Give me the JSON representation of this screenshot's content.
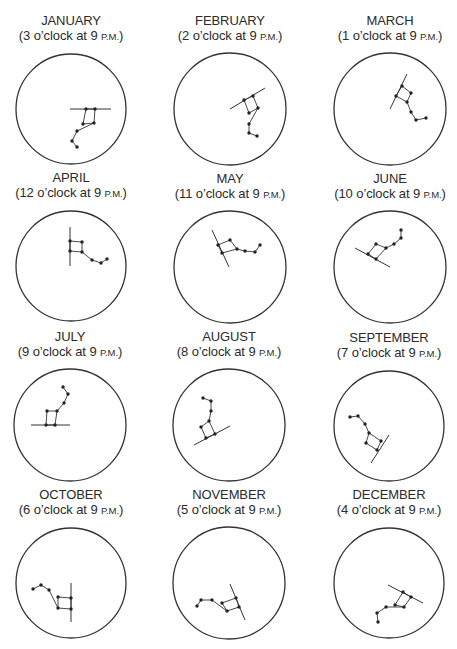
{
  "figure": {
    "panels": [
      {
        "month": "JANUARY",
        "clock": "3",
        "center": [
          71,
          109
        ],
        "r": 55,
        "horizon": [
          [
            70,
            109
          ],
          [
            111,
            109
          ]
        ],
        "stars": [
          [
            86,
            109
          ],
          [
            95,
            109
          ],
          [
            94,
            123
          ],
          [
            83,
            124
          ],
          [
            77,
            131
          ],
          [
            72,
            141
          ],
          [
            77,
            147
          ]
        ]
      },
      {
        "month": "FEBRUARY",
        "clock": "2",
        "center": [
          230,
          109
        ],
        "r": 56,
        "horizon": [
          [
            230,
            109
          ],
          [
            265,
            88
          ]
        ],
        "stars": [
          [
            244,
            100
          ],
          [
            253,
            96
          ],
          [
            258,
            108
          ],
          [
            249,
            113
          ],
          [
            249,
            124
          ],
          [
            249,
            133
          ],
          [
            257,
            136
          ]
        ]
      },
      {
        "month": "MARCH",
        "clock": "1",
        "center": [
          390,
          109
        ],
        "r": 56,
        "horizon": [
          [
            407,
            74
          ],
          [
            390,
            109
          ]
        ],
        "stars": [
          [
            402,
            86
          ],
          [
            411,
            93
          ],
          [
            407,
            102
          ],
          [
            396,
            96
          ],
          [
            411,
            112
          ],
          [
            416,
            120
          ],
          [
            426,
            118
          ]
        ]
      },
      {
        "month": "APRIL",
        "clock": "12",
        "center": [
          71,
          266
        ],
        "r": 55,
        "horizon": [
          [
            70,
            227
          ],
          [
            70,
            266
          ]
        ],
        "stars": [
          [
            70,
            241
          ],
          [
            82,
            242
          ],
          [
            82,
            252
          ],
          [
            70,
            251
          ],
          [
            92,
            260
          ],
          [
            101,
            263
          ],
          [
            107,
            259
          ]
        ]
      },
      {
        "month": "MAY",
        "clock": "11",
        "center": [
          230,
          267
        ],
        "r": 56,
        "horizon": [
          [
            212,
            230
          ],
          [
            229,
            267
          ]
        ],
        "stars": [
          [
            218,
            245
          ],
          [
            230,
            240
          ],
          [
            237,
            249
          ],
          [
            222,
            253
          ],
          [
            245,
            251
          ],
          [
            255,
            252
          ],
          [
            260,
            245
          ]
        ]
      },
      {
        "month": "JUNE",
        "clock": "10",
        "center": [
          390,
          267
        ],
        "r": 56,
        "horizon": [
          [
            355,
            248
          ],
          [
            390,
            267
          ]
        ],
        "stars": [
          [
            368,
            254
          ],
          [
            376,
            259
          ],
          [
            386,
            248
          ],
          [
            376,
            244
          ],
          [
            394,
            244
          ],
          [
            401,
            238
          ],
          [
            401,
            230
          ]
        ]
      },
      {
        "month": "JULY",
        "clock": "9",
        "center": [
          70,
          425
        ],
        "r": 56,
        "horizon": [
          [
            31,
            425
          ],
          [
            70,
            425
          ]
        ],
        "stars": [
          [
            46,
            425
          ],
          [
            55,
            425
          ],
          [
            57,
            411
          ],
          [
            47,
            411
          ],
          [
            64,
            403
          ],
          [
            68,
            394
          ],
          [
            63,
            387
          ]
        ]
      },
      {
        "month": "AUGUST",
        "clock": "8",
        "center": [
          229,
          425
        ],
        "r": 56,
        "horizon": [
          [
            194,
            445
          ],
          [
            230,
            426
          ]
        ],
        "stars": [
          [
            206,
            438
          ],
          [
            215,
            434
          ],
          [
            209,
            421
          ],
          [
            201,
            427
          ],
          [
            211,
            411
          ],
          [
            211,
            401
          ],
          [
            203,
            398
          ]
        ]
      },
      {
        "month": "SEPTEMBER",
        "clock": "7",
        "center": [
          389,
          426
        ],
        "r": 55,
        "horizon": [
          [
            371,
            463
          ],
          [
            389,
            435
          ]
        ],
        "stars": [
          [
            377,
            450
          ],
          [
            381,
            441
          ],
          [
            369,
            433
          ],
          [
            366,
            443
          ],
          [
            365,
            424
          ],
          [
            358,
            416
          ],
          [
            350,
            417
          ]
        ]
      },
      {
        "month": "OCTOBER",
        "clock": "6",
        "center": [
          71,
          583
        ],
        "r": 55,
        "horizon": [
          [
            71,
            583
          ],
          [
            71,
            622
          ]
        ],
        "stars": [
          [
            71,
            598
          ],
          [
            71,
            609
          ],
          [
            58,
            608
          ],
          [
            58,
            597
          ],
          [
            49,
            590
          ],
          [
            41,
            585
          ],
          [
            33,
            589
          ]
        ]
      },
      {
        "month": "NOVEMBER",
        "clock": "5",
        "center": [
          229,
          583
        ],
        "r": 56,
        "horizon": [
          [
            230,
            584
          ],
          [
            245,
            620
          ]
        ],
        "stars": [
          [
            236,
            598
          ],
          [
            239,
            607
          ],
          [
            227,
            611
          ],
          [
            222,
            603
          ],
          [
            212,
            600
          ],
          [
            201,
            600
          ],
          [
            197,
            606
          ]
        ]
      },
      {
        "month": "DECEMBER",
        "clock": "4",
        "center": [
          389,
          583
        ],
        "r": 55,
        "horizon": [
          [
            388,
            585
          ],
          [
            423,
            603
          ]
        ],
        "stars": [
          [
            403,
            592
          ],
          [
            411,
            597
          ],
          [
            404,
            607
          ],
          [
            395,
            605
          ],
          [
            386,
            607
          ],
          [
            377,
            613
          ],
          [
            378,
            622
          ]
        ]
      }
    ],
    "labels": {
      "oclock": "o’clock at 9 ",
      "pm": "P.M."
    }
  }
}
